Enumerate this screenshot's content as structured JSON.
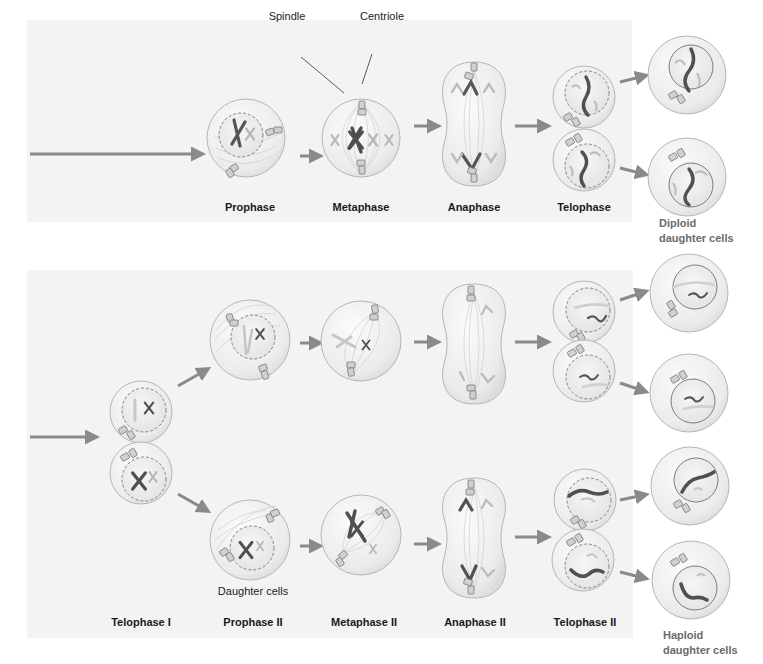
{
  "mitosis": {
    "callouts": {
      "spindle": "Spindle",
      "centriole": "Centriole"
    },
    "phases": [
      "Prophase",
      "Metaphase",
      "Anaphase",
      "Telophase"
    ],
    "result_line1": "Diploid",
    "result_line2": "daughter cells"
  },
  "meiosis": {
    "phases": [
      "Telophase I",
      "Prophase II",
      "Metaphase II",
      "Anaphase II",
      "Telophase II"
    ],
    "daughter_cells_label": "Daughter cells",
    "result_line1": "Haploid",
    "result_line2": "daughter cells"
  },
  "colors": {
    "panel_bg": "#f3f3f3",
    "cell_fill": "#ececec",
    "cell_stroke": "#b4b4b4",
    "arrow": "#8a8a8a",
    "chromosome_dark": "#4a4a4a",
    "chromosome_light": "#bdbdbd"
  }
}
